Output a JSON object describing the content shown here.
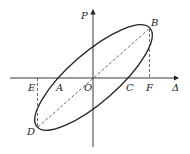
{
  "diagram": {
    "type": "hysteresis-loop",
    "axes": {
      "x_label": "Δ",
      "y_label": "P",
      "origin_label": "O"
    },
    "points": {
      "A": "A",
      "B": "B",
      "C": "C",
      "D": "D",
      "E": "E",
      "F": "F"
    },
    "colors": {
      "stroke": "#222222",
      "background": "#ffffff"
    }
  }
}
